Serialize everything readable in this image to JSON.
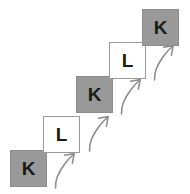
{
  "figure": {
    "name": "staircase-sequence-diagram",
    "background_color": "#ffffff",
    "width": 190,
    "height": 194,
    "filled_color": "#999999",
    "open_color": "#ffffff",
    "border_color": "#999999",
    "text_color": "#1a1a1a",
    "arrow_color": "#8e8e8e"
  },
  "cells": [
    {
      "label": "K",
      "style": "filled",
      "x": 10,
      "y": 150,
      "size": 37,
      "order": 1
    },
    {
      "label": "L",
      "style": "open",
      "x": 43,
      "y": 116,
      "size": 37,
      "order": 2
    },
    {
      "label": "K",
      "style": "filled",
      "x": 76,
      "y": 76,
      "size": 37,
      "order": 3
    },
    {
      "label": "L",
      "style": "open",
      "x": 109,
      "y": 42,
      "size": 37,
      "order": 4
    },
    {
      "label": "K",
      "style": "filled",
      "x": 142,
      "y": 9,
      "size": 37,
      "order": 5
    }
  ],
  "arrows": [
    {
      "name": "step-arrow-1",
      "x": 52,
      "y": 150,
      "width": 28,
      "height": 40
    },
    {
      "name": "step-arrow-2",
      "x": 86,
      "y": 113,
      "width": 28,
      "height": 40
    },
    {
      "name": "step-arrow-3",
      "x": 118,
      "y": 76,
      "width": 28,
      "height": 40
    },
    {
      "name": "step-arrow-4",
      "x": 151,
      "y": 42,
      "width": 28,
      "height": 40
    }
  ]
}
